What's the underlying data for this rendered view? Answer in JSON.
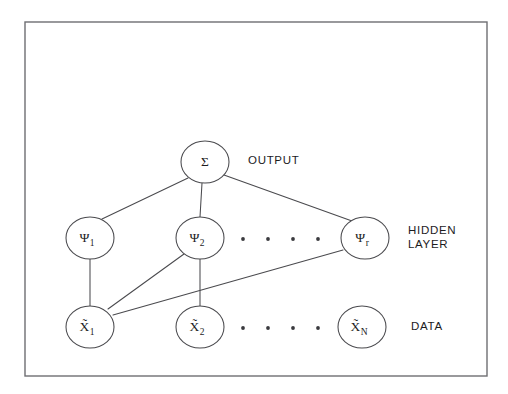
{
  "figure": {
    "frame": {
      "x": 25,
      "y": 22,
      "width": 462,
      "height": 354,
      "stroke_color": "#6e6e72"
    },
    "background_color": "#ffffff",
    "edge_color": "#4a4a4e",
    "node_fill": "#ffffff",
    "node_stroke": "#4a4a4e"
  },
  "layers": {
    "output": {
      "side_label": "OUTPUT",
      "side_label_x": 248,
      "side_label_y": 161,
      "nodes": [
        {
          "id": "sigma",
          "symbol": "Σ",
          "subscript": "",
          "cx": 205,
          "cy": 162,
          "rx": 24,
          "ry": 21
        }
      ]
    },
    "hidden": {
      "side_label_line1": "HIDDEN",
      "side_label_line2": "LAYER",
      "side_label_x": 408,
      "side_label_y1": 231,
      "side_label_y2": 245,
      "nodes": [
        {
          "id": "psi1",
          "symbol": "Ψ",
          "subscript": "1",
          "cx": 90,
          "cy": 238,
          "rx": 24,
          "ry": 21
        },
        {
          "id": "psi2",
          "symbol": "Ψ",
          "subscript": "2",
          "cx": 200,
          "cy": 238,
          "rx": 24,
          "ry": 21
        },
        {
          "id": "psir",
          "symbol": "Ψ",
          "subscript": "r",
          "cx": 365,
          "cy": 238,
          "rx": 24,
          "ry": 21
        }
      ],
      "ellipsis_dots_x": [
        243,
        268,
        293,
        318
      ],
      "ellipsis_dots_y": 239
    },
    "data": {
      "side_label": "DATA",
      "side_label_x": 411,
      "side_label_y": 327,
      "nodes": [
        {
          "id": "x1",
          "symbol": "X̃",
          "subscript": "1",
          "cx": 90,
          "cy": 327,
          "rx": 24,
          "ry": 21
        },
        {
          "id": "x2",
          "symbol": "X̃",
          "subscript": "2",
          "cx": 200,
          "cy": 327,
          "rx": 24,
          "ry": 21
        },
        {
          "id": "xN",
          "symbol": "X̃",
          "subscript": "N",
          "cx": 362,
          "cy": 327,
          "rx": 24,
          "ry": 21
        }
      ],
      "ellipsis_dots_x": [
        243,
        268,
        293,
        318
      ],
      "ellipsis_dots_y": 328
    }
  },
  "edges": [
    {
      "id": "sigma-psi1",
      "from": "sigma",
      "to": "psi1",
      "x1": 188,
      "y1": 178,
      "x2": 102,
      "y2": 219
    },
    {
      "id": "sigma-psi2",
      "from": "sigma",
      "to": "psi2",
      "x1": 202,
      "y1": 183,
      "x2": 200,
      "y2": 217
    },
    {
      "id": "sigma-psir",
      "from": "sigma",
      "to": "psir",
      "x1": 224,
      "y1": 175,
      "x2": 352,
      "y2": 221
    },
    {
      "id": "psi1-x1",
      "from": "psi1",
      "to": "x1",
      "x1": 90,
      "y1": 259,
      "x2": 90,
      "y2": 306
    },
    {
      "id": "psi2-x1",
      "from": "psi2",
      "to": "x1",
      "x1": 184,
      "y1": 254,
      "x2": 108,
      "y2": 309
    },
    {
      "id": "psi2-x2",
      "from": "psi2",
      "to": "x2",
      "x1": 200,
      "y1": 259,
      "x2": 200,
      "y2": 306
    },
    {
      "id": "psir-x1",
      "from": "psir",
      "to": "x1",
      "x1": 343,
      "y1": 250,
      "x2": 113,
      "y2": 315
    }
  ]
}
